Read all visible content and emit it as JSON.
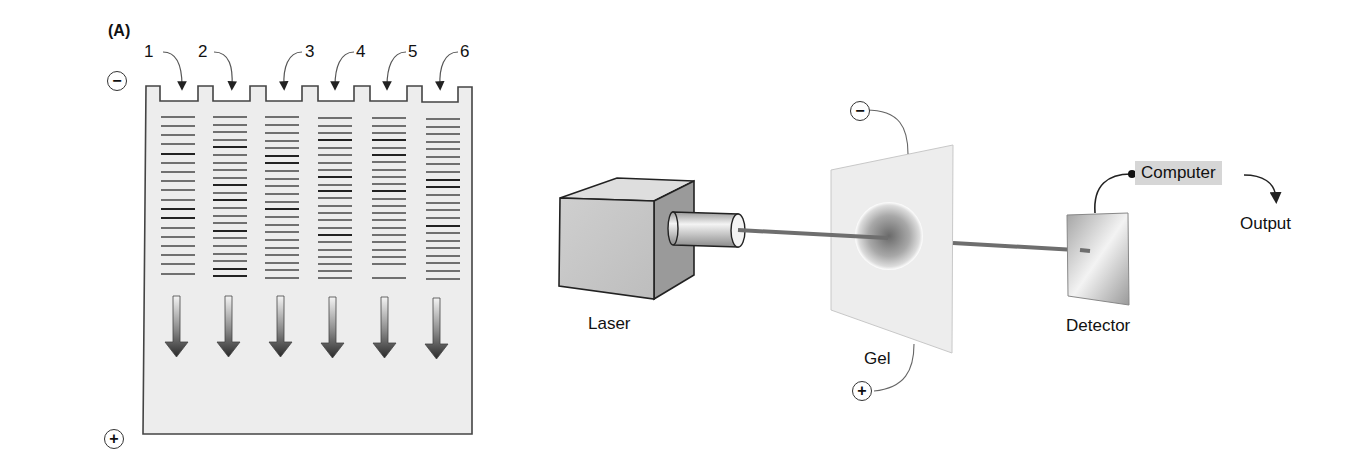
{
  "panel": {
    "label": "(A)"
  },
  "gel_slab": {
    "lanes": [
      {
        "number": "1"
      },
      {
        "number": "2"
      },
      {
        "number": "3"
      },
      {
        "number": "4"
      },
      {
        "number": "5"
      },
      {
        "number": "6"
      }
    ],
    "negative_electrode": "−",
    "positive_electrode": "+"
  },
  "capillary_setup": {
    "laser_label": "Laser",
    "gel_label": "Gel",
    "detector_label": "Detector",
    "computer_label": "Computer",
    "output_label": "Output",
    "negative_electrode": "−",
    "positive_electrode": "+"
  },
  "colors": {
    "gel_fill": "#ededed",
    "outline": "#444444",
    "band": "#6a6a6a",
    "band_dark": "#2a2a2a",
    "beam": "#6e6e6e",
    "computer_box": "#d6d6d6"
  }
}
